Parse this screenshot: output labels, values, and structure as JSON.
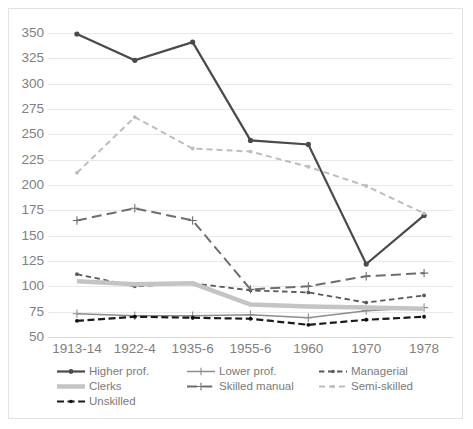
{
  "chart_data": {
    "type": "line",
    "title": "",
    "xlabel": "",
    "ylabel": "",
    "categories": [
      "1913-14",
      "1922-4",
      "1935-6",
      "1955-6",
      "1960",
      "1970",
      "1978"
    ],
    "ylim": [
      50,
      350
    ],
    "ytick_values": [
      50,
      75,
      100,
      125,
      150,
      175,
      200,
      225,
      250,
      275,
      300,
      325,
      350
    ],
    "ytick_labels": [
      "50",
      "75",
      "100",
      "125",
      "150",
      "175",
      "200",
      "225",
      "250",
      "275",
      "300",
      "325",
      "350"
    ],
    "grid": true,
    "legend_position": "bottom",
    "series": [
      {
        "name": "Higher prof.",
        "values": [
          349,
          323,
          341,
          244,
          240,
          122,
          170
        ],
        "color": "#4a4a4a",
        "style": "solid",
        "marker": "circle",
        "width": 2.2
      },
      {
        "name": "Lower prof.",
        "values": [
          73,
          71,
          71,
          72,
          69,
          76,
          79
        ],
        "color": "#8c8c8c",
        "style": "solid",
        "marker": "plus",
        "width": 1.5
      },
      {
        "name": "Managerial",
        "values": [
          112,
          100,
          103,
          96,
          94,
          84,
          91
        ],
        "color": "#595959",
        "style": "dashed",
        "marker": "dot",
        "width": 1.8
      },
      {
        "name": "Clerks",
        "values": [
          105,
          102,
          103,
          82,
          80,
          79,
          78
        ],
        "color": "#c4c4c4",
        "style": "solid",
        "marker": "none",
        "width": 4.5
      },
      {
        "name": "Skilled manual",
        "values": [
          165,
          177,
          165,
          97,
          100,
          110,
          113
        ],
        "color": "#6e6e6e",
        "style": "longdash",
        "marker": "plus",
        "width": 2.0
      },
      {
        "name": "Semi-skilled",
        "values": [
          212,
          267,
          236,
          233,
          218,
          199,
          172
        ],
        "color": "#bdbdbd",
        "style": "dashed",
        "marker": "dot",
        "width": 2.0
      },
      {
        "name": "Unskilled",
        "values": [
          66,
          70,
          69,
          68,
          62,
          67,
          70
        ],
        "color": "#1a1a1a",
        "style": "dashdot",
        "marker": "dot",
        "width": 2.2
      }
    ]
  },
  "legend": {
    "rows": [
      [
        "Higher prof.",
        "Lower prof.",
        "Managerial"
      ],
      [
        "Clerks",
        "Skilled manual",
        "Semi-skilled"
      ],
      [
        "Unskilled"
      ]
    ]
  },
  "colors": {
    "grid": "#e9e9e9",
    "axis_text": "#808080",
    "legend_text": "#7a7a7a",
    "background": "#ffffff",
    "frame": "#e3e3e3"
  }
}
